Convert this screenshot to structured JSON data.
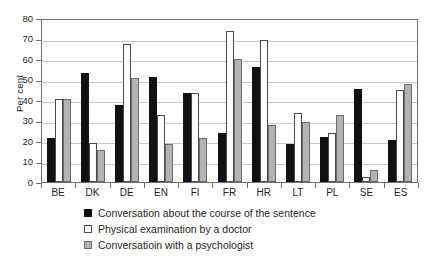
{
  "chart_data": {
    "type": "bar",
    "title": "",
    "xlabel": "",
    "ylabel": "Per cent",
    "ylim": [
      0,
      80
    ],
    "yticks": [
      0,
      10,
      20,
      30,
      40,
      50,
      60,
      70,
      80
    ],
    "grid": true,
    "legend_position": "bottom",
    "categories": [
      "BE",
      "DK",
      "DE",
      "EN",
      "FI",
      "FR",
      "HR",
      "LT",
      "PL",
      "SE",
      "ES"
    ],
    "series": [
      {
        "name": "Conversation about the course of the sentence",
        "swatch": "s0",
        "color": "#111111",
        "values": [
          21.5,
          53.0,
          37.5,
          51.0,
          43.5,
          24.0,
          56.0,
          18.5,
          22.0,
          45.5,
          20.5
        ]
      },
      {
        "name": "Physical examination by a doctor",
        "swatch": "s1",
        "color": "#ffffff",
        "values": [
          40.5,
          19.0,
          67.5,
          32.5,
          43.5,
          73.5,
          69.5,
          33.5,
          24.0,
          2.5,
          45.0
        ]
      },
      {
        "name": "Conversatioin with a psychologist",
        "swatch": "s2",
        "color": "#b3b3b3",
        "values": [
          40.5,
          15.5,
          50.5,
          18.5,
          21.5,
          60.0,
          28.0,
          29.5,
          32.5,
          6.0,
          48.0
        ]
      }
    ]
  }
}
